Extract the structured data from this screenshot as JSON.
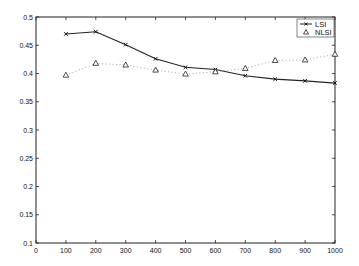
{
  "chart_data": {
    "type": "line",
    "title": "",
    "xlabel": "",
    "ylabel": "",
    "xlim": [
      0,
      1000
    ],
    "ylim": [
      0.1,
      0.5
    ],
    "grid": false,
    "legend_position": "upper right",
    "x": [
      100,
      200,
      300,
      400,
      500,
      600,
      700,
      800,
      900,
      1000
    ],
    "x_ticks": [
      "0",
      "100",
      "200",
      "300",
      "400",
      "500",
      "600",
      "700",
      "800",
      "900",
      "1000"
    ],
    "y_ticks": [
      "0.1",
      "0.15",
      "0.2",
      "0.25",
      "0.3",
      "0.35",
      "0.4",
      "0.45",
      "0.5"
    ],
    "series": [
      {
        "name": "LSI",
        "style": "solid line, x markers",
        "values": [
          0.47,
          0.474,
          0.451,
          0.426,
          0.411,
          0.407,
          0.396,
          0.39,
          0.387,
          0.383
        ]
      },
      {
        "name": "NLSI",
        "style": "dotted line, triangle markers",
        "values": [
          0.397,
          0.418,
          0.415,
          0.406,
          0.399,
          0.403,
          0.409,
          0.423,
          0.424,
          0.434
        ]
      }
    ]
  }
}
